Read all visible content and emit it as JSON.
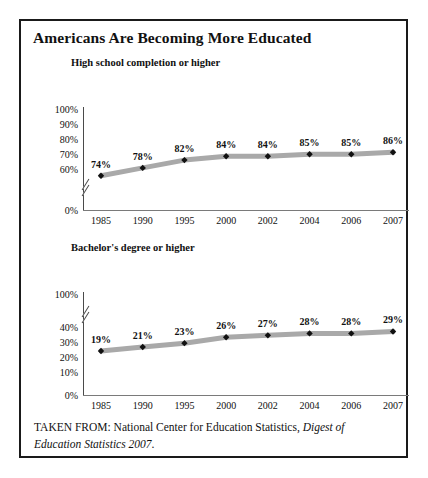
{
  "figure": {
    "title": "Americans Are Becoming More Educated",
    "source_prefix": "TAKEN FROM: National Center for Education Statistics, ",
    "source_italic": "Digest of Education Statistics 2007",
    "source_suffix": "."
  },
  "chart_data": [
    {
      "type": "line",
      "title": "High school completion or higher",
      "xlabel": "",
      "ylabel": "",
      "categories": [
        "1985",
        "1990",
        "1995",
        "2000",
        "2002",
        "2004",
        "2006",
        "2007"
      ],
      "values": [
        74,
        78,
        82,
        84,
        84,
        85,
        85,
        86
      ],
      "value_labels": [
        "74%",
        "78%",
        "82%",
        "84%",
        "84%",
        "85%",
        "85%",
        "86%"
      ],
      "yticks": [
        "100%",
        "90%",
        "80%",
        "70%",
        "60%",
        "0%"
      ],
      "ytick_values": [
        100,
        90,
        80,
        70,
        60,
        0
      ],
      "ylim": [
        60,
        100
      ],
      "axis_break": true,
      "grid": false,
      "legend": "none",
      "line_color": "#a9a9a9",
      "marker_color": "#111111"
    },
    {
      "type": "line",
      "title": "Bachelor's degree or higher",
      "xlabel": "",
      "ylabel": "",
      "categories": [
        "1985",
        "1990",
        "1995",
        "2000",
        "2002",
        "2004",
        "2006",
        "2007"
      ],
      "values": [
        19,
        21,
        23,
        26,
        27,
        28,
        28,
        29
      ],
      "value_labels": [
        "19%",
        "21%",
        "23%",
        "26%",
        "27%",
        "28%",
        "28%",
        "29%"
      ],
      "yticks": [
        "100%",
        "40%",
        "30%",
        "20%",
        "10%",
        "0%"
      ],
      "ytick_values": [
        100,
        40,
        30,
        20,
        10,
        0
      ],
      "ylim": [
        0,
        40
      ],
      "axis_break": true,
      "grid": false,
      "legend": "none",
      "line_color": "#a9a9a9",
      "marker_color": "#111111"
    }
  ]
}
